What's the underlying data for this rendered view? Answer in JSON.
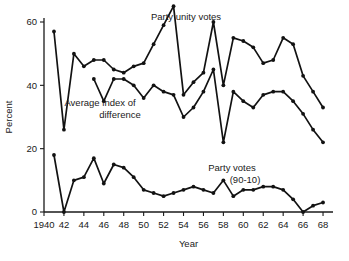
{
  "chart_data": {
    "type": "line",
    "title": "",
    "xlabel": "Year",
    "ylabel": "Percent",
    "xlim": [
      1940,
      1969
    ],
    "ylim": [
      0,
      66
    ],
    "grid": false,
    "legend_position": "inline-annotations",
    "x_ticks": [
      1940,
      1942,
      1944,
      1946,
      1948,
      1950,
      1952,
      1954,
      1956,
      1958,
      1960,
      1962,
      1964,
      1966,
      1968
    ],
    "x_tick_labels": [
      "1940",
      "42",
      "44",
      "46",
      "48",
      "50",
      "52",
      "54",
      "56",
      "58",
      "60",
      "62",
      "64",
      "66",
      "68"
    ],
    "y_ticks": [
      0,
      20,
      40,
      60
    ],
    "y_tick_labels": [
      "0",
      "20",
      "40",
      "60"
    ],
    "series": [
      {
        "name": "Party unity votes",
        "label_text": "Party unity votes",
        "x": [
          1941,
          1942,
          1943,
          1944,
          1945,
          1946,
          1947,
          1948,
          1949,
          1950,
          1951,
          1952,
          1953,
          1954,
          1955,
          1956,
          1957,
          1958,
          1959,
          1960,
          1961,
          1962,
          1963,
          1964,
          1965,
          1966,
          1967,
          1968
        ],
        "values": [
          57,
          26,
          50,
          46,
          48,
          48,
          45,
          44,
          46,
          47,
          53,
          59,
          65,
          37,
          41,
          44,
          60,
          40,
          55,
          54,
          52,
          47,
          48,
          55,
          53,
          43,
          38,
          33
        ]
      },
      {
        "name": "Average index of difference",
        "label_text": "Average index of difference",
        "x": [
          1945,
          1946,
          1947,
          1948,
          1949,
          1950,
          1951,
          1952,
          1953,
          1954,
          1955,
          1956,
          1957,
          1958,
          1959,
          1960,
          1961,
          1962,
          1963,
          1964,
          1965,
          1966,
          1967,
          1968
        ],
        "values": [
          42,
          35,
          42,
          42,
          40,
          36,
          40,
          38,
          37,
          30,
          33,
          38,
          45,
          22,
          38,
          35,
          33,
          37,
          38,
          38,
          35,
          31,
          26,
          22
        ]
      },
      {
        "name": "Party votes (90-10)",
        "label_text": "Party votes",
        "label_text2": "(90-10)",
        "x": [
          1941,
          1942,
          1943,
          1944,
          1945,
          1946,
          1947,
          1948,
          1949,
          1950,
          1951,
          1952,
          1953,
          1954,
          1955,
          1956,
          1957,
          1958,
          1959,
          1960,
          1961,
          1962,
          1963,
          1964,
          1965,
          1966,
          1967,
          1968
        ],
        "values": [
          18,
          0,
          10,
          11,
          17,
          9,
          15,
          14,
          11,
          7,
          6,
          5,
          6,
          7,
          8,
          7,
          6,
          10,
          5,
          7,
          7,
          8,
          8,
          7,
          4,
          0,
          2,
          3
        ]
      }
    ],
    "annotations": [
      {
        "text": "Party unity votes",
        "x_px": 186,
        "y_px": 20
      },
      {
        "text": "Average index of",
        "x_px": 100,
        "y_px": 106
      },
      {
        "text": "difference",
        "x_px": 120,
        "y_px": 118
      },
      {
        "text": "Party votes",
        "x_px": 232,
        "y_px": 171
      },
      {
        "text": "(90-10)",
        "x_px": 245,
        "y_px": 183
      }
    ],
    "colors": {
      "line": "#121212",
      "axis": "#1a1a1a",
      "background": "#ffffff"
    }
  }
}
